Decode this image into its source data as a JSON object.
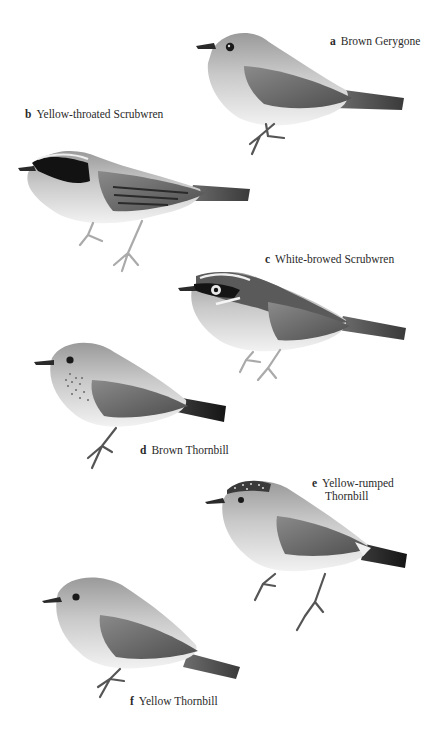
{
  "plate": {
    "header_text": "",
    "palette": {
      "background": "#ffffff",
      "label_text": "#2a2a2a",
      "plumage_light": "#e4e4e4",
      "plumage_mid": "#a8a8a8",
      "plumage_dark": "#6a6a6a",
      "plumage_black": "#1e1e1e"
    },
    "species": [
      {
        "letter": "a",
        "name": "Brown Gerygone"
      },
      {
        "letter": "b",
        "name": "Yellow-throated Scrubwren"
      },
      {
        "letter": "c",
        "name": "White-browed Scrubwren"
      },
      {
        "letter": "d",
        "name": "Brown Thornbill"
      },
      {
        "letter": "e",
        "name": "Yellow-rumped",
        "name_line2": "Thornbill"
      },
      {
        "letter": "f",
        "name": "Yellow Thornbill"
      }
    ]
  }
}
